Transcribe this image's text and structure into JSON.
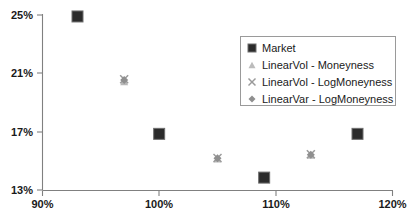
{
  "chart_data": {
    "type": "scatter",
    "title": "",
    "xlabel": "",
    "ylabel": "",
    "xlim": [
      90,
      120
    ],
    "ylim": [
      13,
      25
    ],
    "xticks": [
      "90%",
      "100%",
      "110%",
      "120%"
    ],
    "xtick_values": [
      90,
      100,
      110,
      120
    ],
    "yticks": [
      "13%",
      "17%",
      "21%",
      "25%"
    ],
    "ytick_values": [
      13,
      17,
      21,
      25
    ],
    "grid": false,
    "legend_position": "upper-right",
    "series": [
      {
        "name": "Market",
        "marker": "square",
        "color": "#2b2b2b",
        "points": [
          {
            "x": 93.0,
            "y": 24.9
          },
          {
            "x": 100.0,
            "y": 16.85
          },
          {
            "x": 109.0,
            "y": 13.85
          },
          {
            "x": 117.0,
            "y": 16.85
          }
        ]
      },
      {
        "name": "LinearVol - Moneyness",
        "marker": "triangle",
        "color": "#b8b8b8",
        "points": [
          {
            "x": 97.0,
            "y": 20.45
          },
          {
            "x": 105.0,
            "y": 15.15
          },
          {
            "x": 113.0,
            "y": 15.4
          }
        ]
      },
      {
        "name": "LinearVol - LogMoneyness",
        "marker": "x",
        "color": "#9a9a9a",
        "points": [
          {
            "x": 97.0,
            "y": 20.6
          },
          {
            "x": 105.0,
            "y": 15.2
          },
          {
            "x": 113.0,
            "y": 15.45
          }
        ]
      },
      {
        "name": "LinearVar - LogMoneyness",
        "marker": "diamond",
        "color": "#8f8f8f",
        "points": [
          {
            "x": 97.0,
            "y": 20.55
          },
          {
            "x": 105.0,
            "y": 15.18
          },
          {
            "x": 113.0,
            "y": 15.42
          }
        ]
      }
    ]
  },
  "legend": {
    "items": [
      {
        "label": "Market",
        "marker": "square",
        "color": "#2b2b2b"
      },
      {
        "label": "LinearVol - Moneyness",
        "marker": "triangle",
        "color": "#bcbcbc"
      },
      {
        "label": "LinearVol - LogMoneyness",
        "marker": "x",
        "color": "#9a9a9a"
      },
      {
        "label": "LinearVar - LogMoneyness",
        "marker": "diamond",
        "color": "#8f8f8f"
      }
    ]
  },
  "axes": {
    "y_labels": [
      "25%",
      "21%",
      "17%",
      "13%"
    ],
    "x_labels": [
      "90%",
      "100%",
      "110%",
      "120%"
    ]
  },
  "colors": {
    "axis": "#808080",
    "text": "#1a1a1a",
    "market": "#2b2b2b",
    "legend_border": "#9a9a9a",
    "background": "#ffffff"
  }
}
